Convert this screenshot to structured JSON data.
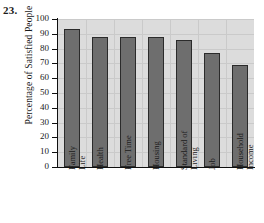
{
  "problem": {
    "number": "23."
  },
  "chart_data": {
    "type": "bar",
    "title": "",
    "xlabel": "",
    "ylabel": "Percentage of Satisfied People",
    "categories": [
      "Family Life",
      "Health",
      "Free Time",
      "Housing",
      "Standard of Living",
      "Job",
      "Household Income"
    ],
    "category_lines": [
      [
        "Family",
        "Life"
      ],
      [
        "Health"
      ],
      [
        "Free Time"
      ],
      [
        "Housing"
      ],
      [
        "Standard of",
        "Living"
      ],
      [
        "Job"
      ],
      [
        "Household",
        "Income"
      ]
    ],
    "values": [
      93,
      88,
      88,
      88,
      86,
      77,
      69
    ],
    "ylim": [
      0,
      100
    ],
    "ytick_labels": [
      "0",
      "10",
      "20",
      "30",
      "40",
      "50",
      "60",
      "70",
      "80",
      "90",
      "100"
    ],
    "ytick_values": [
      0,
      10,
      20,
      30,
      40,
      50,
      60,
      70,
      80,
      90,
      100
    ],
    "grid": true,
    "legend": "none",
    "colors": {
      "bar_fill": "#6e6e6e",
      "bar_edge": "#2b2b2b",
      "plot_background": "#dcdcdc",
      "gridline": "#cacaca",
      "axis": "#101010",
      "text": "#1a1a1a",
      "page_background": "#ffffff"
    }
  }
}
